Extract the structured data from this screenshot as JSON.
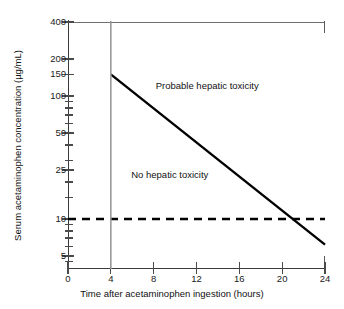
{
  "chart_data": {
    "type": "line",
    "title": "",
    "xlabel": "Time after acetaminophen ingestion (hours)",
    "ylabel": "Serum acetaminophen concentration (µg/mL)",
    "xlim": [
      0,
      24
    ],
    "ylim": [
      4,
      400
    ],
    "yscale": "log",
    "xscale": "linear",
    "grid": false,
    "legend": "none",
    "xticks": [
      {
        "value": 0,
        "label": "0"
      },
      {
        "value": 4,
        "label": "4"
      },
      {
        "value": 8,
        "label": "8"
      },
      {
        "value": 12,
        "label": "12"
      },
      {
        "value": 16,
        "label": "16"
      },
      {
        "value": 20,
        "label": "20"
      },
      {
        "value": 24,
        "label": "24"
      }
    ],
    "yticks": [
      {
        "value": 400,
        "label": "400",
        "minor": false
      },
      {
        "value": 200,
        "label": "200",
        "minor": false
      },
      {
        "value": 150,
        "label": "150",
        "minor": false
      },
      {
        "value": 100,
        "label": "100",
        "minor": false
      },
      {
        "value": 90,
        "label": "",
        "minor": true
      },
      {
        "value": 80,
        "label": "",
        "minor": true
      },
      {
        "value": 70,
        "label": "",
        "minor": true
      },
      {
        "value": 60,
        "label": "",
        "minor": true
      },
      {
        "value": 50,
        "label": "50",
        "minor": false
      },
      {
        "value": 40,
        "label": "",
        "minor": true
      },
      {
        "value": 30,
        "label": "",
        "minor": true
      },
      {
        "value": 25,
        "label": "25",
        "minor": false
      },
      {
        "value": 20,
        "label": "",
        "minor": true
      },
      {
        "value": 15,
        "label": "",
        "minor": true
      },
      {
        "value": 10,
        "label": "10",
        "minor": false
      },
      {
        "value": 9,
        "label": "",
        "minor": true
      },
      {
        "value": 8,
        "label": "",
        "minor": true
      },
      {
        "value": 7,
        "label": "",
        "minor": true
      },
      {
        "value": 6,
        "label": "",
        "minor": true
      },
      {
        "value": 5,
        "label": "5",
        "minor": false
      },
      {
        "value": 4.5,
        "label": "",
        "minor": true
      }
    ],
    "series": [
      {
        "name": "treatment-line",
        "style": "solid",
        "color": "#000000",
        "points": [
          {
            "x": 4,
            "y": 150
          },
          {
            "x": 24,
            "y": 6.2
          }
        ]
      },
      {
        "name": "lower-reference-line",
        "style": "dashed",
        "color": "#000000",
        "points": [
          {
            "x": 0,
            "y": 10
          },
          {
            "x": 24,
            "y": 10
          }
        ]
      },
      {
        "name": "four-hour-marker",
        "style": "vertical",
        "color": "#9a9a9a",
        "points": [
          {
            "x": 4,
            "y": 400
          },
          {
            "x": 4,
            "y": 4
          }
        ]
      }
    ],
    "annotations": [
      {
        "name": "probable-hepatic-toxicity",
        "text": "Probable hepatic toxicity",
        "x": 13,
        "y": 120
      },
      {
        "name": "no-hepatic-toxicity",
        "text": "No hepatic toxicity",
        "x": 9.5,
        "y": 23
      }
    ]
  },
  "axes": {
    "x_title": "Time after acetaminophen ingestion (hours)",
    "y_title": "Serum acetaminophen concentration (µg/mL)"
  },
  "labels": {
    "probable": "Probable hepatic toxicity",
    "none": "No hepatic toxicity"
  }
}
